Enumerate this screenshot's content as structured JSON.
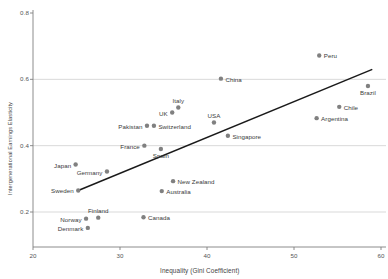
{
  "chart_data": {
    "type": "scatter",
    "title": "",
    "xlabel": "Inequality (Gini Coefficient)",
    "ylabel": "Intergenerational Earnings Elasticity",
    "xlim": [
      20,
      60
    ],
    "ylim": [
      0.13,
      0.82
    ],
    "xticks": [
      20,
      30,
      40,
      50,
      60
    ],
    "yticks": [
      0.2,
      0.4,
      0.6,
      0.8
    ],
    "xtick_labels": [
      "20",
      "30",
      "40",
      "50",
      "60"
    ],
    "ytick_labels": [
      "0.2",
      "0.4",
      "0.6",
      "0.8"
    ],
    "grid": "horizontal",
    "legend": "none",
    "marker_color": "#808080",
    "line_color": "#1a1a1a",
    "grid_color": "#c8c8c8",
    "axis_color": "#808080",
    "points": [
      {
        "name": "Denmark",
        "x": 26.3,
        "y": 0.152,
        "label_pos": "left"
      },
      {
        "name": "Norway",
        "x": 26.1,
        "y": 0.18,
        "label_pos": "left"
      },
      {
        "name": "Finland",
        "x": 27.5,
        "y": 0.183,
        "label_pos": "above"
      },
      {
        "name": "Canada",
        "x": 32.7,
        "y": 0.184,
        "label_pos": "right"
      },
      {
        "name": "Australia",
        "x": 34.8,
        "y": 0.263,
        "label_pos": "right"
      },
      {
        "name": "Sweden",
        "x": 25.2,
        "y": 0.265,
        "label_pos": "left"
      },
      {
        "name": "New Zealand",
        "x": 36.1,
        "y": 0.293,
        "label_pos": "right"
      },
      {
        "name": "Germany",
        "x": 28.5,
        "y": 0.322,
        "label_pos": "left"
      },
      {
        "name": "Japan",
        "x": 24.9,
        "y": 0.343,
        "label_pos": "left"
      },
      {
        "name": "France",
        "x": 32.8,
        "y": 0.4,
        "label_pos": "left"
      },
      {
        "name": "Spain",
        "x": 34.7,
        "y": 0.39,
        "label_pos": "below"
      },
      {
        "name": "Singapore",
        "x": 42.4,
        "y": 0.43,
        "label_pos": "right"
      },
      {
        "name": "Pakistan",
        "x": 33.1,
        "y": 0.46,
        "label_pos": "left"
      },
      {
        "name": "Switzerland",
        "x": 33.9,
        "y": 0.46,
        "label_pos": "right"
      },
      {
        "name": "USA",
        "x": 40.8,
        "y": 0.47,
        "label_pos": "above"
      },
      {
        "name": "UK",
        "x": 36.0,
        "y": 0.5,
        "label_pos": "left"
      },
      {
        "name": "Italy",
        "x": 36.7,
        "y": 0.515,
        "label_pos": "above"
      },
      {
        "name": "Argentina",
        "x": 52.6,
        "y": 0.483,
        "label_pos": "right"
      },
      {
        "name": "Chile",
        "x": 55.2,
        "y": 0.517,
        "label_pos": "right"
      },
      {
        "name": "Brazil",
        "x": 58.5,
        "y": 0.58,
        "label_pos": "below"
      },
      {
        "name": "China",
        "x": 41.6,
        "y": 0.602,
        "label_pos": "right"
      },
      {
        "name": "Peru",
        "x": 52.9,
        "y": 0.672,
        "label_pos": "right"
      }
    ],
    "trendline": {
      "x_start": 25.2,
      "y_start": 0.265,
      "x_end": 59.0,
      "y_end": 0.63
    }
  }
}
